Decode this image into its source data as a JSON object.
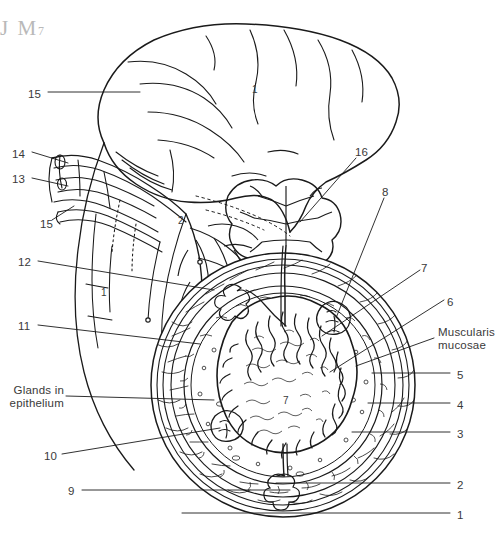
{
  "figure": {
    "watermark": "J M",
    "watermark_sub": "7",
    "stroke_color": "#1a1a1a",
    "label_color": "#3a3a3a",
    "background": "#ffffff"
  },
  "labels": {
    "left": [
      {
        "text": "15",
        "x": 28,
        "y": 88,
        "name": "label-15-top"
      },
      {
        "text": "14",
        "x": 12,
        "y": 148,
        "name": "label-14"
      },
      {
        "text": "13",
        "x": 12,
        "y": 173,
        "name": "label-13"
      },
      {
        "text": "15",
        "x": 40,
        "y": 218,
        "name": "label-15-lower"
      },
      {
        "text": "12",
        "x": 18,
        "y": 256,
        "name": "label-12"
      },
      {
        "text": "11",
        "x": 18,
        "y": 320,
        "name": "label-11"
      },
      {
        "text": "10",
        "x": 44,
        "y": 450,
        "name": "label-10"
      },
      {
        "text": "9",
        "x": 68,
        "y": 485,
        "name": "label-9"
      }
    ],
    "left_text_blocks": [
      {
        "lines": [
          "Glands in",
          "epithelium"
        ],
        "x": 0,
        "y": 384,
        "width": 64,
        "name": "label-glands-in-epithelium"
      }
    ],
    "right": [
      {
        "text": "16",
        "x": 355,
        "y": 146,
        "name": "label-16"
      },
      {
        "text": "8",
        "x": 382,
        "y": 186,
        "name": "label-8"
      },
      {
        "text": "7",
        "x": 421,
        "y": 262,
        "name": "label-7"
      },
      {
        "text": "6",
        "x": 447,
        "y": 296,
        "name": "label-6"
      },
      {
        "text": "5",
        "x": 457,
        "y": 369,
        "name": "label-5"
      },
      {
        "text": "4",
        "x": 457,
        "y": 399,
        "name": "label-4"
      },
      {
        "text": "3",
        "x": 457,
        "y": 428,
        "name": "label-3"
      },
      {
        "text": "2",
        "x": 457,
        "y": 479,
        "name": "label-2"
      },
      {
        "text": "1",
        "x": 457,
        "y": 509,
        "name": "label-1"
      }
    ],
    "right_text_blocks": [
      {
        "lines": [
          "Muscularis",
          "mucosae"
        ],
        "x": 438,
        "y": 326,
        "name": "label-muscularis-mucosae"
      }
    ],
    "inline": [
      {
        "text": "1",
        "x": 252,
        "y": 84,
        "name": "inline-label-1-organ"
      },
      {
        "text": "2",
        "x": 178,
        "y": 215,
        "name": "inline-label-2-mesentery"
      },
      {
        "text": "1",
        "x": 101,
        "y": 287,
        "name": "inline-label-1-serosa"
      },
      {
        "text": "7",
        "x": 283,
        "y": 395,
        "name": "inline-label-7-lumen"
      }
    ]
  }
}
